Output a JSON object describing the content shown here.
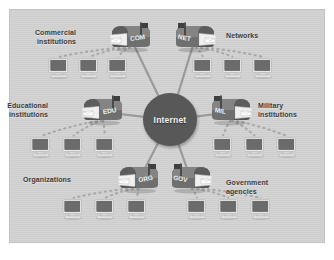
{
  "diagram": {
    "background_color": "#d2d2d2",
    "frame_color": "#ffffff",
    "hub": {
      "label": "Internet",
      "color": "#585858",
      "text_color": "#f2f2f2",
      "cx": 170,
      "cy": 120,
      "r": 27
    },
    "spoke_color": "#9a9a9a",
    "dash_color": "#a8a8a8",
    "nodes": [
      {
        "id": "com",
        "mailbox_label": "COM",
        "label": "Commercial\ninstitutions",
        "label_align": "right",
        "mailbox": {
          "x": 108,
          "y": 22,
          "flip": false
        },
        "label_pos": {
          "x": 56,
          "y": 28
        },
        "computers": [
          {
            "x": 48,
            "y": 58
          },
          {
            "x": 78,
            "y": 58
          },
          {
            "x": 107,
            "y": 58
          }
        ]
      },
      {
        "id": "net",
        "mailbox_label": "NET",
        "label": "Networks",
        "label_align": "left",
        "mailbox": {
          "x": 172,
          "y": 22,
          "flip": true
        },
        "label_pos": {
          "x": 226,
          "y": 31
        },
        "computers": [
          {
            "x": 192,
            "y": 58
          },
          {
            "x": 222,
            "y": 58
          },
          {
            "x": 252,
            "y": 58
          }
        ]
      },
      {
        "id": "edu",
        "mailbox_label": "EDU",
        "label": "Educational\ninstitutions",
        "label_align": "right",
        "mailbox": {
          "x": 80,
          "y": 95,
          "flip": false
        },
        "label_pos": {
          "x": 28,
          "y": 101
        },
        "computers": [
          {
            "x": 30,
            "y": 137
          },
          {
            "x": 62,
            "y": 137
          },
          {
            "x": 94,
            "y": 137
          }
        ]
      },
      {
        "id": "mil",
        "mailbox_label": "MIL",
        "label": "Military\ninstitutions",
        "label_align": "left",
        "mailbox": {
          "x": 208,
          "y": 95,
          "flip": true
        },
        "label_pos": {
          "x": 258,
          "y": 101
        },
        "computers": [
          {
            "x": 212,
            "y": 137
          },
          {
            "x": 244,
            "y": 137
          },
          {
            "x": 276,
            "y": 137
          }
        ]
      },
      {
        "id": "org",
        "mailbox_label": "ORG",
        "label": "Organizations",
        "label_align": "right",
        "mailbox": {
          "x": 116,
          "y": 163,
          "flip": false
        },
        "label_pos": {
          "x": 51,
          "y": 175
        },
        "computers": [
          {
            "x": 62,
            "y": 199
          },
          {
            "x": 94,
            "y": 199
          },
          {
            "x": 126,
            "y": 199
          }
        ]
      },
      {
        "id": "gov",
        "mailbox_label": "GOV",
        "label": "Government\nagencies",
        "label_align": "left",
        "mailbox": {
          "x": 168,
          "y": 163,
          "flip": true
        },
        "label_pos": {
          "x": 226,
          "y": 178
        },
        "computers": [
          {
            "x": 186,
            "y": 199
          },
          {
            "x": 218,
            "y": 199
          },
          {
            "x": 250,
            "y": 199
          }
        ]
      }
    ]
  }
}
